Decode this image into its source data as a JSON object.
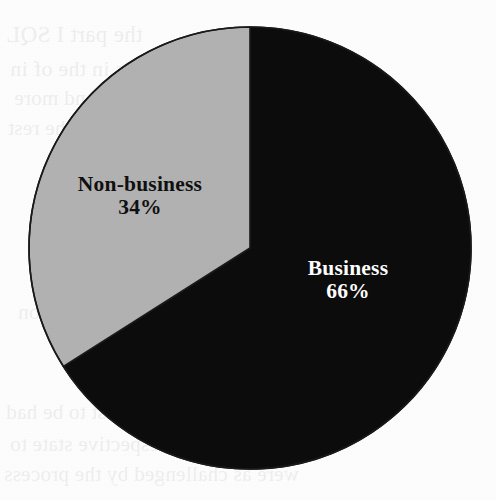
{
  "chart_data": {
    "type": "pie",
    "title": "",
    "subtitle": "",
    "xlabel": "",
    "ylabel": "",
    "legend_position": "none",
    "grid": false,
    "units": "percent",
    "total": 100,
    "start_angle_deg": 0,
    "direction": "clockwise",
    "categories": [
      "Business",
      "Non-business"
    ],
    "values": [
      66,
      34
    ],
    "slices": [
      {
        "label": "Business",
        "value": 66,
        "value_text": "66%",
        "color": "#0c0c0c",
        "text_color": "#ffffff",
        "angle_deg": 237.6,
        "label_x": 348,
        "label_y": 275,
        "value_x": 348,
        "value_y": 298
      },
      {
        "label": "Non-business",
        "value": 34,
        "value_text": "34%",
        "color": "#b2b2b2",
        "text_color": "#101010",
        "angle_deg": 122.4,
        "label_x": 140,
        "label_y": 191,
        "value_x": 140,
        "value_y": 214
      }
    ],
    "geometry": {
      "center_x": 250,
      "center_y": 248,
      "radius": 221,
      "outline_color": "#1a1a1a",
      "outline_width": 1.6
    },
    "colors": {
      "background": "#fdfdfd",
      "business": "#0c0c0c",
      "non_business": "#b2b2b2",
      "outline": "#1a1a1a"
    }
  },
  "page": {
    "background_color": "#fdfdfd",
    "bleed_through": [
      {
        "text": "the part I SQL",
        "x": 6,
        "y": 22,
        "size": 23
      },
      {
        "text": "his in the of in",
        "x": 10,
        "y": 56,
        "size": 22
      },
      {
        "text": "the and more",
        "x": 14,
        "y": 86,
        "size": 21
      },
      {
        "text": "and in the rest",
        "x": 8,
        "y": 116,
        "size": 21
      },
      {
        "text": "the is on",
        "x": 18,
        "y": 300,
        "size": 21
      },
      {
        "text": "consist to be had",
        "x": 6,
        "y": 400,
        "size": 21
      },
      {
        "text": "the respective state to",
        "x": 10,
        "y": 432,
        "size": 21
      },
      {
        "text": "were as challenged by the process",
        "x": 4,
        "y": 462,
        "size": 21
      }
    ]
  }
}
